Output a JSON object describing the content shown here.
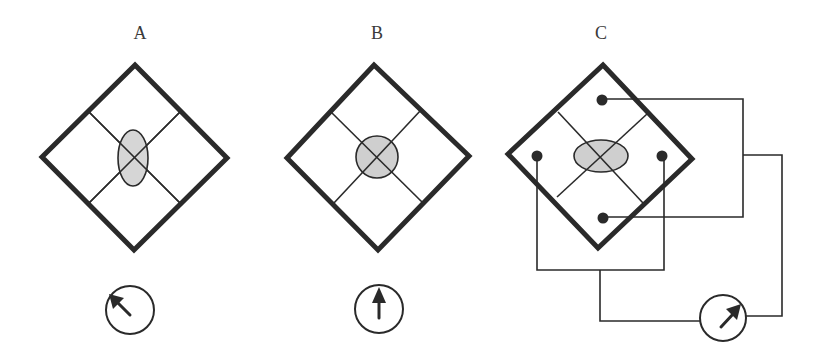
{
  "figure": {
    "panels": [
      {
        "label": "A",
        "inclusion_shape": "vertical-ellipse",
        "meter_needle": "up-left"
      },
      {
        "label": "B",
        "inclusion_shape": "circle",
        "meter_needle": "up"
      },
      {
        "label": "C",
        "inclusion_shape": "horizontal-ellipse",
        "meter_needle": "up-right",
        "electrodes": 4,
        "wired_to_meter": true
      }
    ]
  },
  "colors": {
    "outline": "#2a2a2a",
    "inclusion_fill": "#cfcfcf",
    "background": "#ffffff",
    "text": "#3a3a3a"
  }
}
